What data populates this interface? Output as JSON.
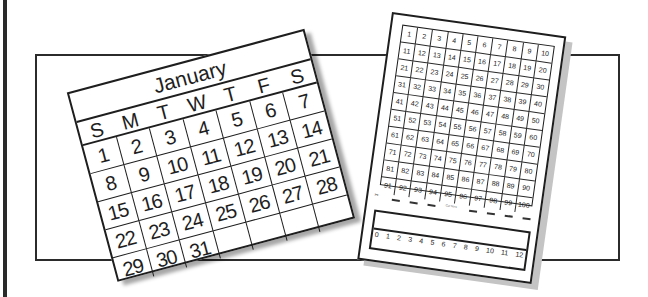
{
  "illustration": {
    "description": "Clip-art of a January calendar and a hundreds chart worksheet inside a rectangular frame",
    "colors": {
      "line": "#1e1e1e",
      "shadow": "#c4c4c4",
      "background": "#ffffff"
    }
  },
  "calendar": {
    "month": "January",
    "weekdays": [
      "S",
      "M",
      "T",
      "W",
      "T",
      "F",
      "S"
    ],
    "weeks": [
      [
        "1",
        "2",
        "3",
        "4",
        "5",
        "6",
        "7"
      ],
      [
        "8",
        "9",
        "10",
        "11",
        "12",
        "13",
        "14"
      ],
      [
        "15",
        "16",
        "17",
        "18",
        "19",
        "20",
        "21"
      ],
      [
        "22",
        "23",
        "24",
        "25",
        "26",
        "27",
        "28"
      ],
      [
        "29",
        "30",
        "31",
        "",
        "",
        "",
        ""
      ]
    ]
  },
  "hundreds_chart": {
    "rows": [
      [
        "1",
        "2",
        "3",
        "4",
        "5",
        "6",
        "7",
        "8",
        "9",
        "10"
      ],
      [
        "11",
        "12",
        "13",
        "14",
        "15",
        "16",
        "17",
        "18",
        "19",
        "20"
      ],
      [
        "21",
        "22",
        "23",
        "24",
        "25",
        "26",
        "27",
        "28",
        "29",
        "30"
      ],
      [
        "31",
        "32",
        "33",
        "34",
        "35",
        "36",
        "37",
        "38",
        "39",
        "40"
      ],
      [
        "41",
        "42",
        "43",
        "44",
        "45",
        "46",
        "47",
        "48",
        "49",
        "50"
      ],
      [
        "51",
        "52",
        "53",
        "54",
        "55",
        "56",
        "57",
        "58",
        "59",
        "60"
      ],
      [
        "61",
        "62",
        "63",
        "64",
        "65",
        "66",
        "67",
        "68",
        "69",
        "70"
      ],
      [
        "71",
        "72",
        "73",
        "74",
        "75",
        "76",
        "77",
        "78",
        "79",
        "80"
      ],
      [
        "81",
        "82",
        "83",
        "84",
        "85",
        "86",
        "87",
        "88",
        "89",
        "90"
      ],
      [
        "91",
        "92",
        "93",
        "94",
        "95",
        "96",
        "97",
        "98",
        "99",
        "100"
      ]
    ],
    "cut_line_label": "✂",
    "cut_line_mid_text": "Cut here",
    "number_line": [
      "0",
      "1",
      "2",
      "3",
      "4",
      "5",
      "6",
      "7",
      "8",
      "9",
      "10",
      "11",
      "12"
    ]
  }
}
